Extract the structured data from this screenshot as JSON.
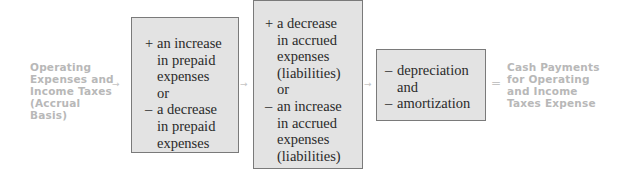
{
  "diagram": {
    "left_label": [
      "Operating",
      "Expenses and",
      "Income Taxes",
      "(Accrual Basis)"
    ],
    "right_label": [
      "Cash Payments",
      "for Operating",
      "and Income",
      "Taxes Expense"
    ],
    "connectors": {
      "arrow": "→",
      "equals": "="
    },
    "box1": {
      "lines": [
        {
          "sign": "+",
          "text": "an increase"
        },
        {
          "sign": "",
          "text": "in prepaid"
        },
        {
          "sign": "",
          "text": "expenses"
        },
        {
          "sign": "",
          "text": "or"
        },
        {
          "sign": "–",
          "text": "a decrease"
        },
        {
          "sign": "",
          "text": "in prepaid"
        },
        {
          "sign": "",
          "text": "expenses"
        }
      ]
    },
    "box2": {
      "lines": [
        {
          "sign": "+",
          "text": "a decrease"
        },
        {
          "sign": "",
          "text": "in accrued"
        },
        {
          "sign": "",
          "text": "expenses"
        },
        {
          "sign": "",
          "text": "(liabilities)"
        },
        {
          "sign": "",
          "text": "or"
        },
        {
          "sign": "–",
          "text": "an increase"
        },
        {
          "sign": "",
          "text": "in accrued"
        },
        {
          "sign": "",
          "text": "expenses"
        },
        {
          "sign": "",
          "text": "(liabilities)"
        }
      ]
    },
    "box3": {
      "lines": [
        {
          "sign": "–",
          "text": "depreciation"
        },
        {
          "sign": "",
          "text": "and"
        },
        {
          "sign": "–",
          "text": "amortization"
        }
      ]
    },
    "colors": {
      "box_fill": "#e3e3e3",
      "box_border": "#7a7a7a",
      "side_label": "#b8b8b8",
      "connector": "#c4c4c4"
    }
  }
}
